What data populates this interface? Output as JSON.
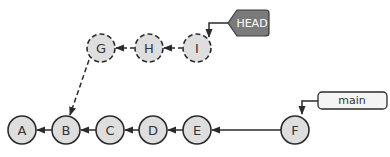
{
  "diagram": {
    "type": "git-commit-graph",
    "colors": {
      "node_fill": "#dedede",
      "node_stroke": "#2b2b2b",
      "edge": "#2b2b2b",
      "head_fill": "#7a7a7a",
      "head_text": "#ffffff",
      "branch_fill": "#f4f4f4",
      "branch_text": "#333333"
    },
    "main_commits": [
      {
        "id": "A",
        "cx": 22,
        "cy": 130
      },
      {
        "id": "B",
        "cx": 66,
        "cy": 130
      },
      {
        "id": "C",
        "cx": 110,
        "cy": 130
      },
      {
        "id": "D",
        "cx": 153,
        "cy": 130
      },
      {
        "id": "E",
        "cx": 197,
        "cy": 130
      },
      {
        "id": "F",
        "cx": 295,
        "cy": 130
      }
    ],
    "detached_commits": [
      {
        "id": "G",
        "cx": 101,
        "cy": 48
      },
      {
        "id": "H",
        "cx": 149,
        "cy": 48
      },
      {
        "id": "I",
        "cx": 197,
        "cy": 48
      }
    ],
    "edges": [
      {
        "from": "B",
        "to": "A",
        "style": "solid"
      },
      {
        "from": "C",
        "to": "B",
        "style": "solid"
      },
      {
        "from": "D",
        "to": "C",
        "style": "solid"
      },
      {
        "from": "E",
        "to": "D",
        "style": "solid"
      },
      {
        "from": "F",
        "to": "E",
        "style": "solid"
      },
      {
        "from": "H",
        "to": "G",
        "style": "dashed"
      },
      {
        "from": "I",
        "to": "H",
        "style": "dashed"
      },
      {
        "from": "G",
        "to": "B",
        "style": "dashed"
      }
    ],
    "refs": {
      "head": {
        "label": "HEAD",
        "points_to": "I"
      },
      "branch": {
        "label": "main",
        "points_to": "F"
      }
    }
  }
}
